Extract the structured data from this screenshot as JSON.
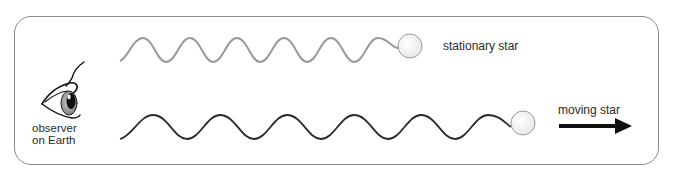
{
  "diagram": {
    "observer": {
      "icon": "eye-icon",
      "label_line1": "observer",
      "label_line2": "on Earth"
    },
    "stationary": {
      "label": "stationary star",
      "wave_color": "#9a9a9a",
      "wavelength_px": 47,
      "cycles": 6
    },
    "moving": {
      "label": "moving star",
      "wave_color": "#2a2a2a",
      "wavelength_px": 67,
      "cycles": 6,
      "direction": "right",
      "arrow_icon": "arrow-right-icon"
    },
    "star_icon": "star-circle-icon",
    "colors": {
      "frame": "#8a8a8a",
      "text": "#2b2b2b",
      "star_fill": "#f4f4f4",
      "star_stroke": "#9a9a9a",
      "arrow": "#111111"
    }
  }
}
